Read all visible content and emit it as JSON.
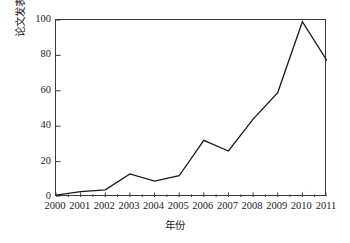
{
  "chart_data": {
    "type": "line",
    "title": "",
    "xlabel": "年份",
    "ylabel": "论文发表数量",
    "categories": [
      "2000",
      "2001",
      "2002",
      "2003",
      "2004",
      "2005",
      "2006",
      "2007",
      "2008",
      "2009",
      "2010",
      "2011"
    ],
    "x": [
      2000,
      2001,
      2002,
      2003,
      2004,
      2005,
      2006,
      2007,
      2008,
      2009,
      2010,
      2011
    ],
    "values": [
      1,
      3,
      4,
      13,
      9,
      12,
      32,
      26,
      44,
      59,
      99,
      77
    ],
    "series": [
      {
        "name": "论文发表数量",
        "values": [
          1,
          3,
          4,
          13,
          9,
          12,
          32,
          26,
          44,
          59,
          99,
          77
        ]
      }
    ],
    "ylim": [
      0,
      100
    ],
    "xlim": [
      2000,
      2011
    ],
    "y_ticks": [
      0,
      20,
      40,
      60,
      80,
      100
    ],
    "y_tick_labels": [
      "0",
      "20",
      "40",
      "60",
      "80",
      "100"
    ],
    "x_ticks": [
      2000,
      2001,
      2002,
      2003,
      2004,
      2005,
      2006,
      2007,
      2008,
      2009,
      2010,
      2011
    ],
    "x_tick_labels": [
      "2000",
      "2001",
      "2002",
      "2003",
      "2004",
      "2005",
      "2006",
      "2007",
      "2008",
      "2009",
      "2010",
      "2011"
    ],
    "grid": false,
    "legend": false,
    "legend_position": "none",
    "line_color": "#1a1a1a",
    "line_width": 1.3,
    "markers": false,
    "frame_color": "#3a3a3a",
    "background_color": "#ffffff"
  }
}
